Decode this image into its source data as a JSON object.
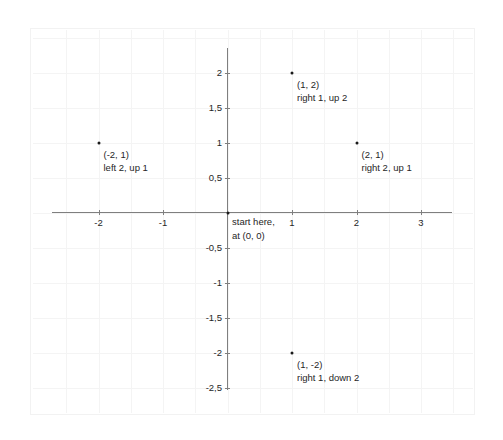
{
  "chart_data": {
    "type": "scatter",
    "title": "",
    "xlabel": "",
    "ylabel": "",
    "xlim": [
      -2.75,
      3.5
    ],
    "ylim": [
      -2.75,
      2.5
    ],
    "grid": true,
    "grid_step": 0.5,
    "legend": "none",
    "decimal_separator": ",",
    "x_ticks": [
      {
        "value": -2,
        "label": "-2"
      },
      {
        "value": -1,
        "label": "-1"
      },
      {
        "value": 1,
        "label": "1"
      },
      {
        "value": 2,
        "label": "2"
      },
      {
        "value": 3,
        "label": "3"
      }
    ],
    "y_ticks": [
      {
        "value": 2,
        "label": "2"
      },
      {
        "value": 1.5,
        "label": "1,5"
      },
      {
        "value": 1,
        "label": "1"
      },
      {
        "value": 0.5,
        "label": "0,5"
      },
      {
        "value": -0.5,
        "label": "-0,5"
      },
      {
        "value": -1,
        "label": "-1"
      },
      {
        "value": -1.5,
        "label": "-1,5"
      },
      {
        "value": -2,
        "label": "-2"
      },
      {
        "value": -2.5,
        "label": "-2,5"
      }
    ],
    "points": [
      {
        "x": 1,
        "y": 2,
        "coord_label": "(1, 2)",
        "move_label": "right 1, up 2"
      },
      {
        "x": -2,
        "y": 1,
        "coord_label": "(-2, 1)",
        "move_label": "left 2, up 1"
      },
      {
        "x": 2,
        "y": 1,
        "coord_label": "(2, 1)",
        "move_label": "right 2, up 1"
      },
      {
        "x": 1,
        "y": -2,
        "coord_label": "(1, -2)",
        "move_label": "right 1, down 2"
      }
    ],
    "origin": {
      "x": 0,
      "y": 0,
      "line1": "start here,",
      "line2": "at (0, 0)"
    },
    "colors": {
      "point": "#1a1a1a",
      "axis": "#7f7f7f",
      "grid": "#f4f4f4",
      "text": "#262626",
      "background": "#ffffff"
    }
  }
}
